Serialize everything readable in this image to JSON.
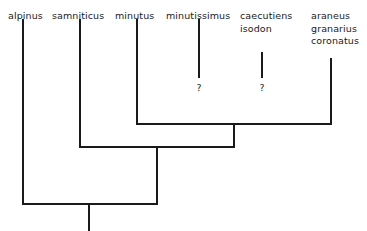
{
  "diagram": {
    "type": "cladogram",
    "title": "",
    "background_color": "#ffffff",
    "line_color": "#1a1a1a",
    "line_width": 1.3,
    "width": 367,
    "height": 231
  },
  "tips": [
    {
      "id": "alpinus",
      "x": 23,
      "label_x": 8,
      "label_lines": [
        "alpinus"
      ],
      "line_top": 20,
      "line_bottom": 204,
      "question_mark": null
    },
    {
      "id": "samniticus",
      "x": 80,
      "label_x": 52,
      "label_lines": [
        "samniticus"
      ],
      "line_top": 20,
      "line_bottom": 147,
      "question_mark": null
    },
    {
      "id": "minutus",
      "x": 137,
      "label_x": 115,
      "label_lines": [
        "minutus"
      ],
      "line_top": 20,
      "line_bottom": 124,
      "question_mark": null
    },
    {
      "id": "minutissimus",
      "x": 199,
      "label_x": 166,
      "label_lines": [
        "minutissimus"
      ],
      "line_top": 20,
      "line_bottom": 77,
      "question_mark": "?"
    },
    {
      "id": "caecutiens-isodon",
      "x": 262,
      "label_x": 240,
      "label_lines": [
        "caecutiens",
        "isodon"
      ],
      "line_top": 53,
      "line_bottom": 77,
      "question_mark": "?"
    },
    {
      "id": "araneus-granarius-coronatus",
      "x": 331,
      "label_x": 311,
      "label_lines": [
        "araneus",
        "granarius",
        "coronatus"
      ],
      "line_top": 59,
      "line_bottom": 124,
      "question_mark": null
    }
  ],
  "question_marks": [
    {
      "id": "qmark-minutissimus",
      "x": 199,
      "y": 83,
      "text": "?"
    },
    {
      "id": "qmark-caecutiens",
      "x": 262,
      "y": 83,
      "text": "?"
    }
  ],
  "nodes": [
    {
      "id": "node-minutus-araneus",
      "y": 124,
      "x_left": 137,
      "x_right": 331,
      "stem_x": 234,
      "stem_bottom": 147
    },
    {
      "id": "node-samniticus-clade",
      "y": 147,
      "x_left": 80,
      "x_right": 234,
      "stem_x": 157,
      "stem_bottom": 204
    },
    {
      "id": "node-root",
      "y": 204,
      "x_left": 23,
      "x_right": 157,
      "stem_x": 89,
      "stem_bottom": 231
    }
  ],
  "internal_tip_stems": [
    {
      "id": "stem-minutissimus-to-node",
      "x": 199,
      "y_top": 20,
      "y_bottom": 77
    },
    {
      "id": "stem-caecutiens-to-node",
      "x": 262,
      "y_top": 53,
      "y_bottom": 77
    }
  ],
  "label_text": {
    "alpinus": "alpinus",
    "samniticus": "samniticus",
    "minutus": "minutus",
    "minutissimus": "minutissimus",
    "caecutiens": "caecutiens",
    "isodon": "isodon",
    "araneus": "araneus",
    "granarius": "granarius",
    "coronatus": "coronatus",
    "question": "?"
  }
}
